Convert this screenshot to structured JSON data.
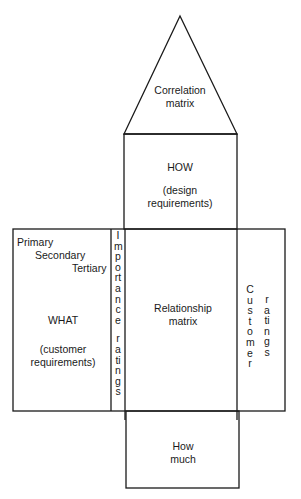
{
  "roof": {
    "line1": "Correlation",
    "line2": "matrix"
  },
  "how": {
    "title": "HOW",
    "sub1": "(design",
    "sub2": "requirements)"
  },
  "what": {
    "levels": [
      "Primary",
      "Secondary",
      "Tertiary"
    ],
    "title": "WHAT",
    "sub1": "(customer",
    "sub2": "requirements)"
  },
  "importance": {
    "word1": "Importance",
    "word2": "ratings"
  },
  "relationship": {
    "line1": "Relationship",
    "line2": "matrix"
  },
  "customer": {
    "word1": "Customer",
    "word2": "ratings"
  },
  "how_much": {
    "line1": "How",
    "line2": "much"
  },
  "colors": {
    "line": "#1a1a1a",
    "background": "#ffffff"
  }
}
